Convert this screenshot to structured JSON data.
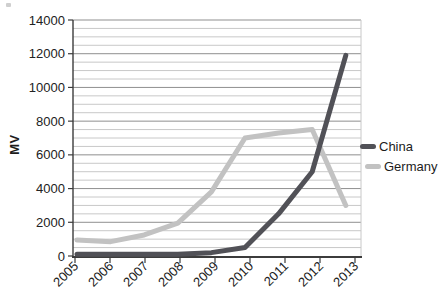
{
  "figure": {
    "background": "#ffffff",
    "legend": {
      "position": "right",
      "entries": [
        {
          "label": "China",
          "marker_color": "#515157"
        },
        {
          "label": "Germany",
          "marker_color": "#c2c2c2"
        }
      ]
    }
  },
  "chart_data": {
    "type": "line",
    "title": "",
    "xlabel": "",
    "ylabel": "MV",
    "categories": [
      "2005",
      "2006",
      "2007",
      "2008",
      "2009",
      "2010",
      "2011",
      "2012",
      "2013"
    ],
    "series": [
      {
        "name": "China",
        "color": "#515157",
        "values": [
          100,
          100,
          100,
          100,
          200,
          500,
          2500,
          5000,
          11900
        ]
      },
      {
        "name": "Germany",
        "color": "#c2c2c2",
        "values": [
          950,
          850,
          1250,
          1950,
          3800,
          7000,
          7300,
          7500,
          3000
        ]
      }
    ],
    "ylim": [
      0,
      14000
    ],
    "y_major": 2000,
    "y_minor": 500,
    "y_ticks": [
      "0",
      "2000",
      "4000",
      "6000",
      "8000",
      "10000",
      "12000",
      "14000"
    ],
    "grid": "horizontal",
    "legend_position": "right",
    "style": {
      "grid_minor_color": "#c8c8c8",
      "grid_major_color": "#8f8f8f",
      "axis_color": "#3c3c3c",
      "label_color": "#222222",
      "line_width": 5
    }
  }
}
